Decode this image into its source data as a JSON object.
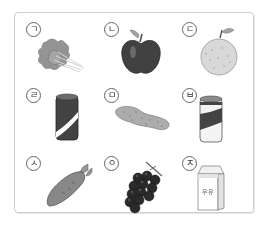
{
  "items": [
    {
      "label": "ㄱ",
      "name": "spinach",
      "row": 0,
      "col": 0
    },
    {
      "label": "ㄴ",
      "name": "apple",
      "row": 0,
      "col": 1
    },
    {
      "label": "ㄷ",
      "name": "pear",
      "row": 0,
      "col": 2
    },
    {
      "label": "ㄹ",
      "name": "can-dark",
      "row": 1,
      "col": 0
    },
    {
      "label": "ㅁ",
      "name": "cucumber",
      "row": 1,
      "col": 1
    },
    {
      "label": "ㅂ",
      "name": "can-light",
      "row": 1,
      "col": 2
    },
    {
      "label": "ㅅ",
      "name": "carrot",
      "row": 2,
      "col": 0
    },
    {
      "label": "ㅇ",
      "name": "grapes",
      "row": 2,
      "col": 1
    },
    {
      "label": "ㅈ",
      "name": "milk-carton",
      "row": 2,
      "col": 2
    }
  ],
  "milk_carton_text": "우유"
}
